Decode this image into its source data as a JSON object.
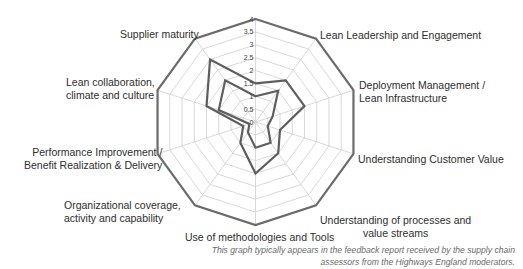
{
  "chart_data": {
    "type": "radar",
    "title": "",
    "axes": [
      "",
      "Lean Leadership and Engagement",
      "Deployment Management / Lean Infrastructure",
      "Understanding Customer Value",
      "Understanding of processes and value streams",
      "Use of methodologies and Tools",
      "Organizational coverage, activity and capability",
      "Performance Improvement / Benefit Realization & Delivery",
      "Lean collaboration, climate and culture",
      "Supplier maturity"
    ],
    "range": [
      0,
      4
    ],
    "ticks": [
      "0",
      "0.5",
      "1",
      "1.5",
      "2",
      "2.5",
      "3",
      "3.5",
      "4"
    ],
    "grid": true,
    "series": [
      {
        "name": "Maximum",
        "values": [
          4,
          4,
          4,
          4,
          4,
          4,
          4,
          4,
          4,
          4
        ],
        "color": "#6b6b6b"
      },
      {
        "name": "Series A",
        "values": [
          1.5,
          2.0,
          2.0,
          1.0,
          1.5,
          2.0,
          1.0,
          0.5,
          2.0,
          3.0
        ],
        "color": "#5e5e5e"
      },
      {
        "name": "Series B",
        "values": [
          1.0,
          1.5,
          0.7,
          0.5,
          1.0,
          1.0,
          0.5,
          0.25,
          1.5,
          2.0
        ],
        "color": "#5e5e5e"
      }
    ]
  },
  "labels": {
    "supplier_maturity": "Supplier maturity",
    "lean_leadership": "Lean Leadership and Engagement",
    "lean_collab_1": "Lean collaboration,",
    "lean_collab_2": "climate and culture",
    "deployment_1": "Deployment Management /",
    "deployment_2": "Lean Infrastructure",
    "performance_1": "Performance Improvement /",
    "performance_2": "Benefit Realization & Delivery",
    "customer_value": "Understanding Customer Value",
    "organizational_1": "Organizational coverage,",
    "organizational_2": "activity and capability",
    "processes_1": "Understanding of processes and",
    "processes_2": "value streams",
    "methodologies": "Use of methodologies and Tools"
  },
  "caption": {
    "line1": "This graph typically appears in the feedback report received by the supply chain",
    "line2": "assessors from the Highways England moderators."
  }
}
